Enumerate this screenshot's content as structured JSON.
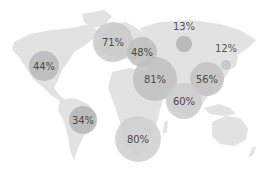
{
  "chart_data": {
    "type": "bubble-map",
    "title": "",
    "map": "world",
    "colors": {
      "land": "#e2e2e2",
      "background": "#ffffff"
    },
    "bubbles": [
      {
        "label": "44%",
        "value": 44,
        "region": "North America",
        "cx": 44,
        "cy": 66,
        "r": 15,
        "color": "#b8b8b8"
      },
      {
        "label": "71%",
        "value": 71,
        "region": "Northern Europe",
        "cx": 113,
        "cy": 42,
        "r": 20,
        "color": "#c9c9c9"
      },
      {
        "label": "48%",
        "value": 48,
        "region": "Eastern Europe",
        "cx": 142,
        "cy": 52,
        "r": 15,
        "color": "#bdbdbd"
      },
      {
        "label": "13%",
        "value": 13,
        "region": "Russia",
        "cx": 184,
        "cy": 44,
        "r": 8,
        "color": "#b3b3b3",
        "label_outside": true,
        "ly": 30
      },
      {
        "label": "12%",
        "value": 12,
        "region": "East Asia",
        "cx": 226,
        "cy": 65,
        "r": 5,
        "color": "#c4c4c4",
        "label_outside": true,
        "ly": 52
      },
      {
        "label": "81%",
        "value": 81,
        "region": "Middle East",
        "cx": 155,
        "cy": 79,
        "r": 22,
        "color": "#c0c0c0"
      },
      {
        "label": "56%",
        "value": 56,
        "region": "China",
        "cx": 207,
        "cy": 79,
        "r": 17,
        "color": "#c2c2c2"
      },
      {
        "label": "60%",
        "value": 60,
        "region": "South Asia",
        "cx": 184,
        "cy": 101,
        "r": 18,
        "color": "#cccccc"
      },
      {
        "label": "34%",
        "value": 34,
        "region": "South America",
        "cx": 83,
        "cy": 120,
        "r": 14,
        "color": "#b5b5b5"
      },
      {
        "label": "80%",
        "value": 80,
        "region": "Africa",
        "cx": 138,
        "cy": 139,
        "r": 23,
        "color": "#cfcfcf"
      }
    ]
  }
}
